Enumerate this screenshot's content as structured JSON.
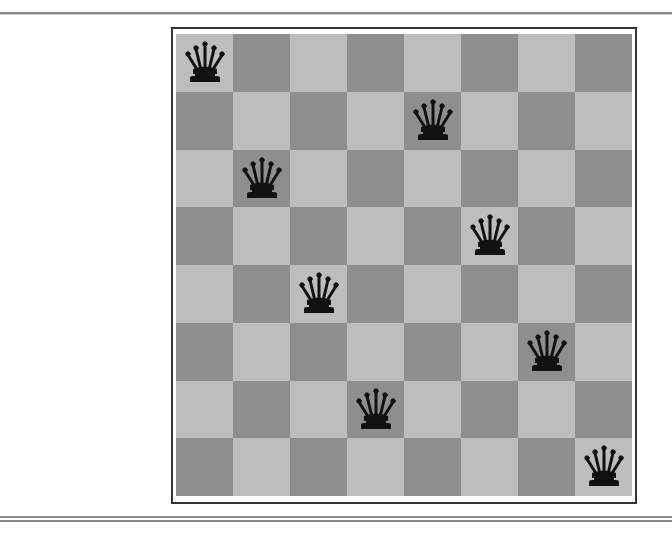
{
  "puzzle": {
    "title": "",
    "board_size": 8,
    "colors": {
      "light": "#bdbdbd",
      "dark": "#8e8e8e",
      "piece": "#111111"
    },
    "piece_type": "queen",
    "piece_icon": "queen-icon",
    "queens": [
      {
        "row": 0,
        "col": 0
      },
      {
        "row": 1,
        "col": 4
      },
      {
        "row": 2,
        "col": 1
      },
      {
        "row": 3,
        "col": 5
      },
      {
        "row": 4,
        "col": 2
      },
      {
        "row": 5,
        "col": 6
      },
      {
        "row": 6,
        "col": 3
      },
      {
        "row": 7,
        "col": 7
      }
    ]
  }
}
